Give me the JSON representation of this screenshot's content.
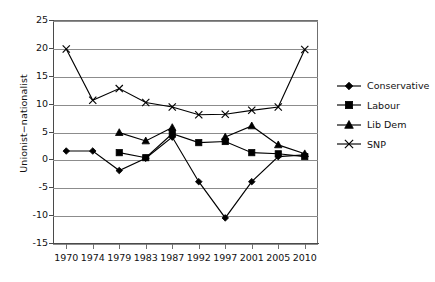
{
  "chart_data": {
    "type": "line",
    "title": "",
    "xlabel": "",
    "ylabel": "Unionist−nationalist",
    "categories": [
      "1970",
      "1974",
      "1979",
      "1983",
      "1987",
      "1992",
      "1997",
      "2001",
      "2005",
      "2010"
    ],
    "yticks": [
      25,
      20,
      15,
      10,
      5,
      0,
      -5,
      -10,
      -15
    ],
    "ylim": [
      -15,
      25
    ],
    "grid": true,
    "legend_position": "right",
    "series": [
      {
        "name": "Conservative",
        "marker": "diamond",
        "values": [
          1.5,
          1.5,
          -2.0,
          0.2,
          4.0,
          -4.0,
          -10.5,
          -4.0,
          0.5,
          0.8
        ]
      },
      {
        "name": "Labour",
        "marker": "square",
        "values": [
          null,
          null,
          1.2,
          0.3,
          4.6,
          3.0,
          3.2,
          1.2,
          1.0,
          0.5
        ]
      },
      {
        "name": "Lib Dem",
        "marker": "triangle",
        "values": [
          null,
          null,
          4.8,
          3.3,
          5.7,
          null,
          4.0,
          6.0,
          2.6,
          1.0
        ]
      },
      {
        "name": "SNP",
        "marker": "cross",
        "values": [
          19.8,
          10.6,
          12.7,
          10.2,
          9.4,
          8.0,
          8.1,
          8.8,
          9.4,
          19.7
        ]
      }
    ]
  }
}
